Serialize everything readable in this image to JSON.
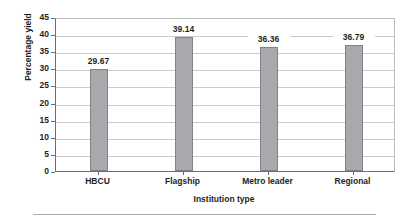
{
  "chart_data": {
    "type": "bar",
    "title": "",
    "categories": [
      "HBCU",
      "Flagship",
      "Metro leader",
      "Regional"
    ],
    "values": [
      29.67,
      39.14,
      36.36,
      36.79
    ],
    "value_labels": [
      "29.67",
      "39.14",
      "36.36",
      "36.79"
    ],
    "xlabel": "Institution type",
    "ylabel": "Percentage yield",
    "ylim": [
      0,
      45
    ],
    "ytick_step": 5,
    "yticks": [
      0,
      5,
      10,
      15,
      20,
      25,
      30,
      35,
      40,
      45
    ],
    "ytick_labels": [
      "0",
      "5",
      "10",
      "15",
      "20",
      "25",
      "30",
      "35",
      "40",
      "45"
    ],
    "grid": true,
    "grid_axis": "y",
    "legend": false,
    "legend_position": "none",
    "series": [
      {
        "name": "Percentage yield",
        "values": [
          29.67,
          39.14,
          36.36,
          36.79
        ],
        "color": "#a7a9ac",
        "edge_color": "#808285"
      }
    ]
  },
  "colors": {
    "bar_fill": "#a7a9ac",
    "bar_edge": "#808285",
    "grid": "#c9cbcd",
    "axis": "#6d6e71",
    "text": "#231f20",
    "background": "#ffffff",
    "rule": "#a7a9ac"
  }
}
